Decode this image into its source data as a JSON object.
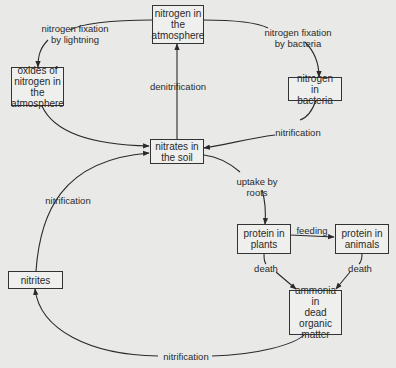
{
  "diagram": {
    "title": "",
    "colors": {
      "background": "#e9e9e7",
      "box_fill": "#efefed",
      "stroke": "#333333",
      "text": "#2a2a2a"
    },
    "nodes": {
      "atmosphere_n2": {
        "label": "nitrogen in\nthe\natmosphere"
      },
      "oxides": {
        "label": "oxides of\nnitrogen in\nthe\natmosphere"
      },
      "bacteria": {
        "label": "nitrogen in\nbacteria"
      },
      "nitrates": {
        "label": "nitrates in\nthe soil"
      },
      "plants": {
        "label": "protein in\nplants"
      },
      "animals": {
        "label": "protein in\nanimals"
      },
      "nitrites": {
        "label": "nitrites"
      },
      "ammonia": {
        "label": "ammonia in\ndead\norganic\nmatter"
      }
    },
    "edges": {
      "lightning": {
        "label": "nitrogen fixation\nby lightning",
        "from": "nitrogen in the atmosphere",
        "to": "oxides of nitrogen in the atmosphere"
      },
      "bacteria_fix": {
        "label": "nitrogen fixation\nby bacteria",
        "from": "nitrogen in the atmosphere",
        "to": "nitrogen in bacteria"
      },
      "denitrification": {
        "label": "denitrification",
        "from": "nitrates in the soil",
        "to": "nitrogen in the atmosphere"
      },
      "nitrification_bacteria": {
        "label": "nitrification",
        "from": "nitrogen in bacteria",
        "to": "nitrates in the soil"
      },
      "oxides_to_nitrates": {
        "label": "",
        "from": "oxides of nitrogen in the atmosphere",
        "to": "nitrates in the soil"
      },
      "uptake": {
        "label": "uptake by\nroots",
        "from": "nitrates in the soil",
        "to": "protein in plants"
      },
      "feeding": {
        "label": "feeding",
        "from": "protein in plants",
        "to": "protein in animals"
      },
      "death_plants": {
        "label": "death",
        "from": "protein in plants",
        "to": "ammonia in dead organic matter"
      },
      "death_animals": {
        "label": "death",
        "from": "protein in animals",
        "to": "ammonia in dead organic matter"
      },
      "nitrification_ammonia": {
        "label": "nitrification",
        "from": "ammonia in dead organic matter",
        "to": "nitrites"
      },
      "nitrification_nitrites": {
        "label": "nitrification",
        "from": "nitrites",
        "to": "nitrates in the soil"
      }
    }
  }
}
